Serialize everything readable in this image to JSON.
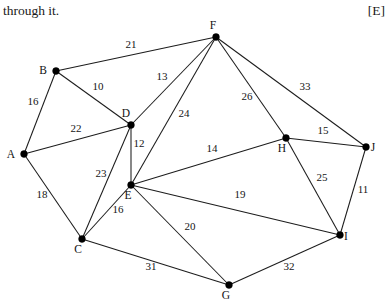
{
  "header": {
    "left_text": "through it.",
    "right_text": "[E]"
  },
  "graph": {
    "caption": "weighted undirected network graph with ten vertices",
    "nodes": [
      {
        "id": "A",
        "label": "A",
        "x": 24,
        "y": 154,
        "label_dx": -13,
        "label_dy": 4
      },
      {
        "id": "B",
        "label": "B",
        "x": 56,
        "y": 71,
        "label_dx": -13,
        "label_dy": 3
      },
      {
        "id": "C",
        "label": "C",
        "x": 82,
        "y": 239,
        "label_dx": -4,
        "label_dy": 14
      },
      {
        "id": "D",
        "label": "D",
        "x": 131,
        "y": 125,
        "label_dx": -5,
        "label_dy": -8
      },
      {
        "id": "E",
        "label": "E",
        "x": 131,
        "y": 185,
        "label_dx": -3,
        "label_dy": 14
      },
      {
        "id": "F",
        "label": "F",
        "x": 216,
        "y": 37,
        "label_dx": -3,
        "label_dy": -8
      },
      {
        "id": "G",
        "label": "G",
        "x": 229,
        "y": 285,
        "label_dx": -3,
        "label_dy": 14
      },
      {
        "id": "H",
        "label": "H",
        "x": 286,
        "y": 138,
        "label_dx": -4,
        "label_dy": 14
      },
      {
        "id": "I",
        "label": "I",
        "x": 340,
        "y": 235,
        "label_dx": 6,
        "label_dy": 5
      },
      {
        "id": "J",
        "label": "J",
        "x": 366,
        "y": 147,
        "label_dx": 7,
        "label_dy": 4
      }
    ],
    "edges": [
      {
        "from": "A",
        "to": "B",
        "weight": "16",
        "lx": 33,
        "ly": 105
      },
      {
        "from": "A",
        "to": "D",
        "weight": "22",
        "lx": 76,
        "ly": 132
      },
      {
        "from": "A",
        "to": "C",
        "weight": "18",
        "lx": 42,
        "ly": 198
      },
      {
        "from": "B",
        "to": "D",
        "weight": "10",
        "lx": 98,
        "ly": 90
      },
      {
        "from": "B",
        "to": "F",
        "weight": "21",
        "lx": 131,
        "ly": 48
      },
      {
        "from": "C",
        "to": "D",
        "weight": "23",
        "lx": 101,
        "ly": 177
      },
      {
        "from": "C",
        "to": "E",
        "weight": "16",
        "lx": 118,
        "ly": 213
      },
      {
        "from": "C",
        "to": "G",
        "weight": "31",
        "lx": 151,
        "ly": 270
      },
      {
        "from": "D",
        "to": "E",
        "weight": "12",
        "lx": 139,
        "ly": 147
      },
      {
        "from": "D",
        "to": "F",
        "weight": "13",
        "lx": 162,
        "ly": 80
      },
      {
        "from": "E",
        "to": "F",
        "weight": "24",
        "lx": 184,
        "ly": 117
      },
      {
        "from": "E",
        "to": "H",
        "weight": "14",
        "lx": 212,
        "ly": 152
      },
      {
        "from": "E",
        "to": "I",
        "weight": "19",
        "lx": 240,
        "ly": 198
      },
      {
        "from": "E",
        "to": "G",
        "weight": "20",
        "lx": 190,
        "ly": 230
      },
      {
        "from": "F",
        "to": "H",
        "weight": "26",
        "lx": 247,
        "ly": 100
      },
      {
        "from": "F",
        "to": "J",
        "weight": "33",
        "lx": 305,
        "ly": 90
      },
      {
        "from": "G",
        "to": "I",
        "weight": "32",
        "lx": 289,
        "ly": 270
      },
      {
        "from": "H",
        "to": "J",
        "weight": "15",
        "lx": 323,
        "ly": 134
      },
      {
        "from": "H",
        "to": "I",
        "weight": "25",
        "lx": 322,
        "ly": 181
      },
      {
        "from": "I",
        "to": "J",
        "weight": "11",
        "lx": 363,
        "ly": 193
      }
    ]
  }
}
